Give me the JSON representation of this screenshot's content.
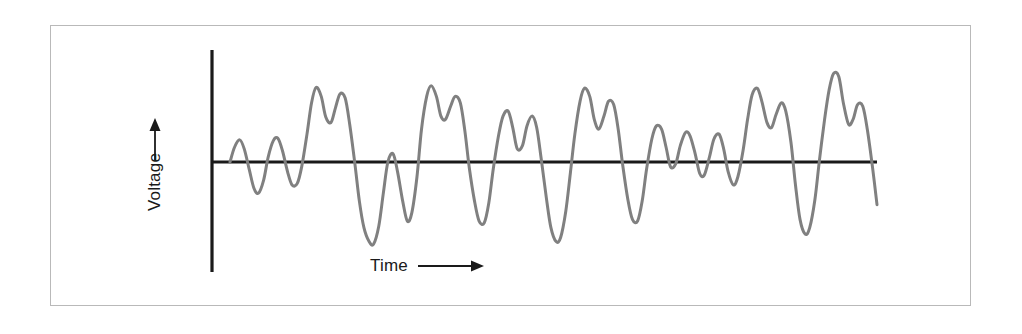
{
  "figure": {
    "type": "waveform-plot",
    "background_color": "#ffffff",
    "frame_color": "#b9b9b9",
    "axis_color": "#1a1a1a",
    "waveform_color": "#808080"
  },
  "axes": {
    "y_label": "Voltage",
    "y_arrow_direction": "up",
    "x_label": "Time",
    "x_arrow_direction": "right",
    "origin_x_px": 212,
    "baseline_y_px": 162,
    "y_axis_top_px": 50,
    "y_axis_bottom_px": 272,
    "x_axis_right_px": 877
  },
  "chart_data": {
    "type": "line",
    "title": "",
    "subtitle": "",
    "xlabel": "Time",
    "ylabel": "Voltage",
    "legend": [],
    "legend_position": "none",
    "grid": false,
    "xlim": [
      0,
      1
    ],
    "ylim": [
      -1,
      1
    ],
    "x_tick_labels": [],
    "y_tick_labels": [],
    "annotations": [],
    "series": [
      {
        "name": "voltage",
        "color": "#808080",
        "line_width_px": 3,
        "x": [
          0.0,
          0.007,
          0.015,
          0.022,
          0.03,
          0.037,
          0.044,
          0.052,
          0.059,
          0.067,
          0.074,
          0.081,
          0.089,
          0.096,
          0.104,
          0.111,
          0.119,
          0.126,
          0.133,
          0.141,
          0.148,
          0.156,
          0.163,
          0.17,
          0.178,
          0.185,
          0.193,
          0.2,
          0.207,
          0.215,
          0.222,
          0.23,
          0.237,
          0.244,
          0.252,
          0.259,
          0.267,
          0.274,
          0.281,
          0.289,
          0.296,
          0.304,
          0.311,
          0.319,
          0.326,
          0.333,
          0.341,
          0.348,
          0.356,
          0.363,
          0.37,
          0.378,
          0.385,
          0.393,
          0.4,
          0.407,
          0.415,
          0.422,
          0.43,
          0.437,
          0.444,
          0.452,
          0.459,
          0.467,
          0.474,
          0.481,
          0.489,
          0.496,
          0.504,
          0.511,
          0.519,
          0.526,
          0.533,
          0.541,
          0.548,
          0.556,
          0.563,
          0.57,
          0.578,
          0.585,
          0.593,
          0.6,
          0.607,
          0.615,
          0.622,
          0.63,
          0.637,
          0.644,
          0.652,
          0.659,
          0.667,
          0.674,
          0.681,
          0.689,
          0.696,
          0.704,
          0.711,
          0.719,
          0.726,
          0.733,
          0.741,
          0.748,
          0.756,
          0.763,
          0.77,
          0.778,
          0.785,
          0.793,
          0.8,
          0.807,
          0.815,
          0.822,
          0.83,
          0.837,
          0.844,
          0.852,
          0.859,
          0.867,
          0.874,
          0.881,
          0.889,
          0.896,
          0.904,
          0.911,
          0.919,
          0.926,
          0.933,
          0.941,
          0.948,
          0.956,
          0.963,
          0.97,
          0.978,
          0.985,
          0.993,
          1.0
        ],
        "y": [
          0.0,
          0.18,
          0.27,
          0.16,
          -0.1,
          -0.32,
          -0.38,
          -0.22,
          0.06,
          0.26,
          0.29,
          0.14,
          -0.12,
          -0.28,
          -0.26,
          -0.05,
          0.34,
          0.72,
          0.91,
          0.8,
          0.55,
          0.48,
          0.66,
          0.83,
          0.78,
          0.46,
          -0.02,
          -0.48,
          -0.8,
          -0.97,
          -1.0,
          -0.78,
          -0.38,
          0.0,
          0.1,
          -0.12,
          -0.48,
          -0.72,
          -0.62,
          -0.18,
          0.4,
          0.8,
          0.93,
          0.8,
          0.56,
          0.52,
          0.68,
          0.8,
          0.72,
          0.38,
          -0.08,
          -0.48,
          -0.72,
          -0.74,
          -0.5,
          -0.08,
          0.32,
          0.56,
          0.62,
          0.42,
          0.16,
          0.2,
          0.44,
          0.56,
          0.42,
          0.04,
          -0.44,
          -0.8,
          -0.97,
          -0.92,
          -0.6,
          -0.14,
          0.34,
          0.74,
          0.9,
          0.8,
          0.52,
          0.4,
          0.56,
          0.74,
          0.7,
          0.4,
          -0.04,
          -0.46,
          -0.7,
          -0.72,
          -0.48,
          -0.08,
          0.28,
          0.44,
          0.4,
          0.18,
          -0.06,
          -0.02,
          0.2,
          0.36,
          0.32,
          0.1,
          -0.14,
          -0.16,
          0.06,
          0.28,
          0.34,
          0.16,
          -0.12,
          -0.28,
          -0.18,
          0.14,
          0.52,
          0.82,
          0.9,
          0.74,
          0.48,
          0.42,
          0.58,
          0.72,
          0.62,
          0.24,
          -0.28,
          -0.7,
          -0.88,
          -0.8,
          -0.46,
          0.02,
          0.52,
          0.88,
          1.08,
          1.04,
          0.72,
          0.46,
          0.52,
          0.7,
          0.68,
          0.4,
          -0.06,
          -0.52
        ]
      }
    ]
  }
}
